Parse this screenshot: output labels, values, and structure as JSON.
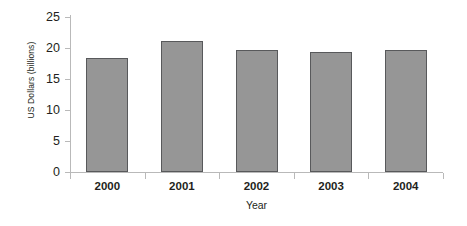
{
  "chart_data": {
    "type": "bar",
    "title": "",
    "xlabel": "Year",
    "ylabel": "US Dollars (billions)",
    "categories": [
      "2000",
      "2001",
      "2002",
      "2003",
      "2004"
    ],
    "values": [
      18.4,
      21.2,
      19.6,
      19.4,
      19.7
    ],
    "series": [
      {
        "name": "US Dollars (billions)",
        "values": [
          18.4,
          21.2,
          19.6,
          19.4,
          19.7
        ]
      }
    ],
    "ylim": [
      0,
      25
    ],
    "ytick_labels": [
      "0",
      "5",
      "10",
      "15",
      "20",
      "25"
    ],
    "ytick_values": [
      0,
      5,
      10,
      15,
      20,
      25
    ],
    "xlim_categories": 5,
    "grid": false,
    "legend": false,
    "legend_position": "none",
    "bar_fill_color": "#969696",
    "bar_border_color": "#58595b",
    "axis_color": "#b9b9b9",
    "text_color": "#231f20",
    "background_color": "#ffffff"
  },
  "axes": {
    "y_title": "US Dollars (billions)",
    "x_title": "Year"
  }
}
